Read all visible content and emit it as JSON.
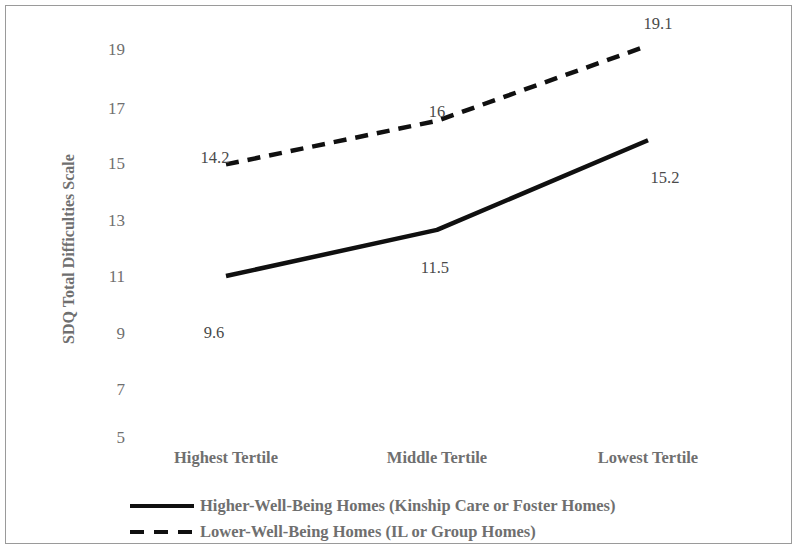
{
  "chart_data": {
    "type": "line",
    "title": "",
    "xlabel": "",
    "ylabel": "SDQ Total Difficulties Scale",
    "categories": [
      "Highest Tertile",
      "Middle Tertile",
      "Lowest Tertile"
    ],
    "ylim": [
      4,
      20
    ],
    "yticks": [
      19,
      17,
      15,
      13,
      11,
      9,
      7,
      5
    ],
    "ytick_labels": [
      "19",
      "17",
      "15",
      "13",
      "11",
      "9",
      "7",
      "5"
    ],
    "grid": false,
    "legend_position": "bottom",
    "series": [
      {
        "name": "Higher-Well-Being Homes (Kinship Care or Foster Homes)",
        "style": "solid",
        "color": "#101010",
        "values": [
          9.6,
          11.5,
          15.2
        ],
        "value_labels": [
          "9.6",
          "11.5",
          "15.2"
        ]
      },
      {
        "name": "Lower-Well-Being Homes (IL or Group Homes)",
        "style": "dashed",
        "color": "#101010",
        "values": [
          14.2,
          16,
          19.1
        ],
        "value_labels": [
          "14.2",
          "16",
          "19.1"
        ]
      }
    ]
  },
  "axis": {
    "y_title": "SDQ Total Difficulties Scale",
    "ytick_0": "19",
    "ytick_1": "17",
    "ytick_2": "15",
    "ytick_3": "13",
    "ytick_4": "11",
    "ytick_5": "9",
    "ytick_6": "7",
    "ytick_7": "5",
    "xtick_0": "Highest Tertile",
    "xtick_1": "Middle Tertile",
    "xtick_2": "Lowest Tertile"
  },
  "point_labels": {
    "dashed_0": "14.2",
    "dashed_1": "16",
    "dashed_2": "19.1",
    "solid_0": "9.6",
    "solid_1": "11.5",
    "solid_2": "15.2"
  },
  "legend": {
    "item_0": "Higher-Well-Being Homes (Kinship Care or Foster Homes)",
    "item_1": "Lower-Well-Being Homes (IL or Group Homes)"
  }
}
